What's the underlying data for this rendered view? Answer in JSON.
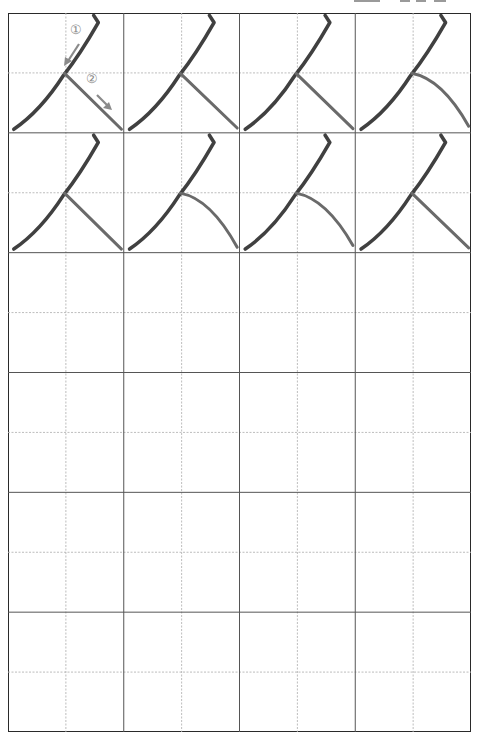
{
  "worksheet": {
    "title": "Handwriting practice sheet",
    "character": "人",
    "columns": 4,
    "rows": 6,
    "model_rows": 2,
    "practice_rows": 4,
    "stroke_order": [
      {
        "label": "①",
        "direction": "down-left"
      },
      {
        "label": "②",
        "direction": "down-right"
      }
    ],
    "colors": {
      "border": "#2a2a2a",
      "cell_line": "#555555",
      "guide_line": "#b5b5b5",
      "ink": "#1e1e1e",
      "ink_light": "#6a6a6a",
      "annotation": "#8a8a8a"
    }
  }
}
